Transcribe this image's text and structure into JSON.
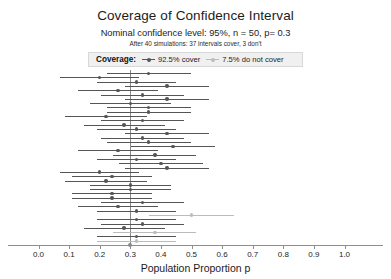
{
  "header": {
    "title": "Coverage of Confidence Interval",
    "subtitle": "Nominal confidence level: 95%, n = 50, p= 0.3",
    "subsubtitle": "After 40 simulations: 37 intervals cover, 3 don't"
  },
  "legend": {
    "title": "Coverage:",
    "entries": [
      {
        "label": "92.5% cover",
        "key_icon": "line-with-dot-marker",
        "color": "#555555"
      },
      {
        "label": "7.5% do not cover",
        "key_icon": "line-with-dot-marker",
        "color": "#b9b9b9"
      }
    ]
  },
  "axis": {
    "title": "Population Proportion p",
    "ticks": [
      "0.0",
      "0.1",
      "0.2",
      "0.3",
      "0.4",
      "0.5",
      "0.6",
      "0.7",
      "0.8",
      "0.9",
      "1.0"
    ],
    "reference_marker_value": 0.3
  },
  "colors": {
    "cover": "#555555",
    "not_cover": "#bcbcbc",
    "reference_line": "#8a8a8a",
    "axis": "#8f8f8f",
    "legend_background": "#f0f0f0",
    "legend_border": "#d8d8d8",
    "text": "#1c1c1c",
    "background": "#ffffff"
  },
  "chart_data": {
    "type": "scatter",
    "title": "Coverage of Confidence Interval",
    "subtitle": "Nominal confidence level: 95%, n = 50, p= 0.3",
    "annotation": "After 40 simulations: 37 intervals cover, 3 don't",
    "xlabel": "Population Proportion p",
    "ylabel": "",
    "xlim": [
      0.0,
      1.0
    ],
    "xticks": [
      0.0,
      0.1,
      0.2,
      0.3,
      0.4,
      0.5,
      0.6,
      0.7,
      0.8,
      0.9,
      1.0
    ],
    "grid": false,
    "legend_position": "top",
    "reference_line_x": 0.3,
    "nominal_confidence_level": 0.95,
    "sample_size": 50,
    "true_proportion": 0.3,
    "n_simulations": 40,
    "n_cover": 37,
    "n_not_cover": 3,
    "pct_cover": "92.5%",
    "pct_not_cover": "7.5%",
    "series": [
      {
        "name": "92.5% cover",
        "color": "#555555"
      },
      {
        "name": "7.5% do not cover",
        "color": "#bcbcbc"
      }
    ],
    "intervals": [
      {
        "i": 1,
        "estimate": 0.36,
        "low": 0.223,
        "high": 0.497,
        "covers": true
      },
      {
        "i": 2,
        "estimate": 0.2,
        "low": 0.07,
        "high": 0.33,
        "covers": true
      },
      {
        "i": 3,
        "estimate": 0.32,
        "low": 0.19,
        "high": 0.45,
        "covers": true
      },
      {
        "i": 4,
        "estimate": 0.42,
        "low": 0.283,
        "high": 0.557,
        "covers": true
      },
      {
        "i": 5,
        "estimate": 0.26,
        "low": 0.13,
        "high": 0.39,
        "covers": true
      },
      {
        "i": 6,
        "estimate": 0.34,
        "low": 0.205,
        "high": 0.475,
        "covers": true
      },
      {
        "i": 7,
        "estimate": 0.42,
        "low": 0.283,
        "high": 0.557,
        "covers": true
      },
      {
        "i": 8,
        "estimate": 0.3,
        "low": 0.167,
        "high": 0.433,
        "covers": true
      },
      {
        "i": 9,
        "estimate": 0.36,
        "low": 0.223,
        "high": 0.497,
        "covers": true
      },
      {
        "i": 10,
        "estimate": 0.36,
        "low": 0.223,
        "high": 0.497,
        "covers": true
      },
      {
        "i": 11,
        "estimate": 0.22,
        "low": 0.085,
        "high": 0.355,
        "covers": true
      },
      {
        "i": 12,
        "estimate": 0.34,
        "low": 0.205,
        "high": 0.475,
        "covers": true
      },
      {
        "i": 13,
        "estimate": 0.28,
        "low": 0.148,
        "high": 0.412,
        "covers": true
      },
      {
        "i": 14,
        "estimate": 0.32,
        "low": 0.19,
        "high": 0.45,
        "covers": true
      },
      {
        "i": 15,
        "estimate": 0.42,
        "low": 0.283,
        "high": 0.557,
        "covers": true
      },
      {
        "i": 16,
        "estimate": 0.34,
        "low": 0.205,
        "high": 0.475,
        "covers": true
      },
      {
        "i": 17,
        "estimate": 0.36,
        "low": 0.223,
        "high": 0.497,
        "covers": true
      },
      {
        "i": 18,
        "estimate": 0.44,
        "low": 0.302,
        "high": 0.578,
        "covers": true
      },
      {
        "i": 19,
        "estimate": 0.26,
        "low": 0.13,
        "high": 0.39,
        "covers": true
      },
      {
        "i": 20,
        "estimate": 0.38,
        "low": 0.245,
        "high": 0.515,
        "covers": true
      },
      {
        "i": 21,
        "estimate": 0.32,
        "low": 0.19,
        "high": 0.45,
        "covers": true
      },
      {
        "i": 22,
        "estimate": 0.4,
        "low": 0.264,
        "high": 0.536,
        "covers": true
      },
      {
        "i": 23,
        "estimate": 0.42,
        "low": 0.283,
        "high": 0.557,
        "covers": true
      },
      {
        "i": 24,
        "estimate": 0.2,
        "low": 0.07,
        "high": 0.33,
        "covers": true
      },
      {
        "i": 25,
        "estimate": 0.24,
        "low": 0.108,
        "high": 0.372,
        "covers": true
      },
      {
        "i": 26,
        "estimate": 0.22,
        "low": 0.085,
        "high": 0.355,
        "covers": true
      },
      {
        "i": 27,
        "estimate": 0.3,
        "low": 0.167,
        "high": 0.433,
        "covers": true
      },
      {
        "i": 28,
        "estimate": 0.3,
        "low": 0.167,
        "high": 0.433,
        "covers": true
      },
      {
        "i": 29,
        "estimate": 0.24,
        "low": 0.108,
        "high": 0.372,
        "covers": true
      },
      {
        "i": 30,
        "estimate": 0.24,
        "low": 0.108,
        "high": 0.372,
        "covers": true
      },
      {
        "i": 31,
        "estimate": 0.34,
        "low": 0.205,
        "high": 0.475,
        "covers": true
      },
      {
        "i": 32,
        "estimate": 0.26,
        "low": 0.13,
        "high": 0.39,
        "covers": true
      },
      {
        "i": 33,
        "estimate": 0.32,
        "low": 0.19,
        "high": 0.45,
        "covers": true
      },
      {
        "i": 34,
        "estimate": 0.5,
        "low": 0.361,
        "high": 0.639,
        "covers": false
      },
      {
        "i": 35,
        "estimate": 0.32,
        "low": 0.19,
        "high": 0.45,
        "covers": true
      },
      {
        "i": 36,
        "estimate": 0.34,
        "low": 0.205,
        "high": 0.475,
        "covers": true
      },
      {
        "i": 37,
        "estimate": 0.28,
        "low": 0.148,
        "high": 0.412,
        "covers": true
      },
      {
        "i": 38,
        "estimate": 0.38,
        "low": 0.245,
        "high": 0.515,
        "covers": false
      },
      {
        "i": 39,
        "estimate": 0.32,
        "low": 0.19,
        "high": 0.45,
        "covers": true
      },
      {
        "i": 40,
        "estimate": 0.32,
        "low": 0.19,
        "high": 0.45,
        "covers": false
      }
    ]
  }
}
